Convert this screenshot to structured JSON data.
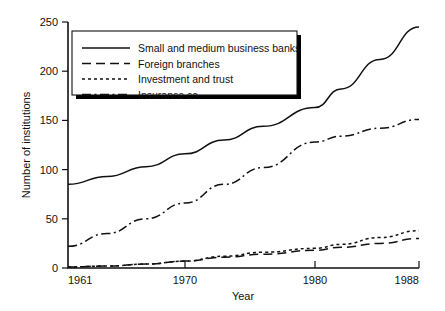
{
  "chart_data": {
    "type": "line",
    "title": "",
    "xlabel": "Year",
    "ylabel": "Number of institutions",
    "xlim": [
      1961,
      1988
    ],
    "ylim": [
      0,
      250
    ],
    "xticks": [
      1961,
      1970,
      1980,
      1988
    ],
    "xtick_labels": [
      "1961",
      "1970",
      "1980",
      "1988"
    ],
    "yticks": [
      0,
      50,
      100,
      150,
      200,
      250
    ],
    "ytick_labels": [
      "0",
      "50",
      "100",
      "150",
      "200",
      "250"
    ],
    "grid": false,
    "legend_position": "upper-left",
    "line_color": "#111111",
    "background_color": "#ffffff",
    "series": [
      {
        "name": "Small and medium business banks",
        "style": "solid",
        "x": [
          1961,
          1964,
          1967,
          1970,
          1973,
          1976,
          1980,
          1982,
          1985,
          1988
        ],
        "values": [
          85,
          93,
          103,
          116,
          130,
          144,
          163,
          182,
          212,
          245
        ]
      },
      {
        "name": "Foreign branches",
        "style": "dashed",
        "x": [
          1961,
          1964,
          1967,
          1970,
          1973,
          1976,
          1980,
          1982,
          1985,
          1988
        ],
        "values": [
          1,
          2,
          4,
          7,
          11,
          14,
          18,
          21,
          25,
          30
        ]
      },
      {
        "name": "Investment and trust",
        "style": "dotted",
        "x": [
          1961,
          1964,
          1967,
          1970,
          1973,
          1976,
          1980,
          1982,
          1985,
          1988
        ],
        "values": [
          1,
          2,
          4,
          7,
          12,
          16,
          20,
          24,
          31,
          38
        ]
      },
      {
        "name": "Insurance co.",
        "style": "dashdot",
        "x": [
          1961,
          1964,
          1967,
          1970,
          1973,
          1976,
          1980,
          1982,
          1985,
          1988
        ],
        "values": [
          22,
          35,
          50,
          66,
          85,
          102,
          128,
          134,
          142,
          151
        ]
      }
    ]
  },
  "legend": {
    "entries": [
      {
        "label": "Small and medium business banks",
        "style": "solid"
      },
      {
        "label": "Foreign branches",
        "style": "dashed"
      },
      {
        "label": "Investment and trust",
        "style": "dotted"
      },
      {
        "label": "Insurance co.",
        "style": "dashdot"
      }
    ]
  }
}
